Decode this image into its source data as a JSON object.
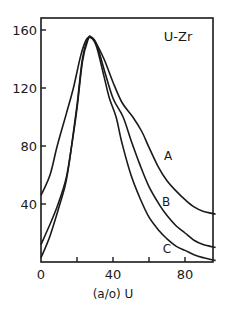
{
  "chart_data": {
    "type": "line",
    "title": "U-Zr",
    "xlabel": "(a/o) U",
    "ylabel": "",
    "xlim": [
      0,
      97
    ],
    "ylim": [
      0,
      165
    ],
    "xticks": [
      0,
      20,
      40,
      60,
      80
    ],
    "xtick_labels": [
      "0",
      "40",
      "80"
    ],
    "yticks": [
      40,
      80,
      120,
      160
    ],
    "ytick_labels": [
      "40",
      "80",
      "120",
      "160"
    ],
    "grid": false,
    "legend": "inline labels near right of curves",
    "series": [
      {
        "name": "A",
        "x": [
          0,
          5,
          9,
          14,
          18,
          22,
          25,
          27,
          30,
          35,
          40,
          45,
          51,
          56,
          60,
          65,
          70,
          75,
          80,
          85,
          90,
          97
        ],
        "y": [
          46,
          60,
          80,
          102,
          120,
          142,
          153,
          155,
          152,
          140,
          124,
          110,
          100,
          90,
          79,
          66,
          56,
          49,
          43,
          38,
          35,
          33
        ]
      },
      {
        "name": "B",
        "x": [
          0,
          5,
          9.5,
          14,
          17,
          20,
          23,
          26,
          28,
          31,
          35,
          40,
          45.6,
          50,
          55,
          60,
          66,
          70,
          75,
          80,
          85,
          90,
          97
        ],
        "y": [
          12,
          26,
          40,
          58,
          80,
          106,
          138,
          153,
          155,
          150,
          133,
          113,
          100,
          84,
          67,
          52,
          39,
          32,
          25,
          20,
          15,
          12,
          10
        ]
      },
      {
        "name": "C",
        "x": [
          0,
          5,
          10.5,
          14,
          17,
          20,
          23,
          26,
          28,
          31,
          35,
          38,
          41.7,
          45,
          50,
          55,
          60,
          66,
          70,
          75,
          80,
          85,
          90,
          97
        ],
        "y": [
          3,
          18,
          40,
          56,
          80,
          108,
          140,
          154,
          155,
          148,
          128,
          113,
          100,
          82,
          60,
          44,
          31,
          21,
          16,
          11,
          8,
          5,
          3,
          1
        ]
      }
    ],
    "annotations": [
      {
        "text": "U-Zr",
        "x": 83,
        "y": 157
      },
      {
        "text": "A",
        "x": 70,
        "y": 74
      },
      {
        "text": "B",
        "x": 69,
        "y": 42
      },
      {
        "text": "C",
        "x": 70,
        "y": 10
      }
    ]
  },
  "labels": {
    "title": "U-Zr",
    "xlabel": "(a/o) U",
    "curve_a": "A",
    "curve_b": "B",
    "curve_c": "C"
  }
}
